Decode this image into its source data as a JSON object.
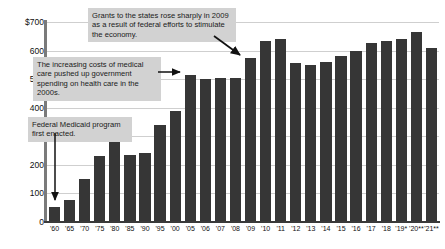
{
  "chart_data": {
    "type": "bar",
    "title": "",
    "subtitle": "",
    "xlabel": "",
    "ylabel": "",
    "ylim": [
      0,
      700
    ],
    "grid": true,
    "legend": "none",
    "y_ticks": [
      "$700",
      "600",
      "500",
      "400",
      "300",
      "200",
      "100",
      "0"
    ],
    "y_tick_values": [
      700,
      600,
      500,
      400,
      300,
      200,
      100,
      0
    ],
    "categories": [
      "'60",
      "'65",
      "'70",
      "'75",
      "'80",
      "'85",
      "'90",
      "'95",
      "'00",
      "'05",
      "'06",
      "'07",
      "'08",
      "'09",
      "'10",
      "'11",
      "'12",
      "'13",
      "'14",
      "'15",
      "'16",
      "'17",
      "'18",
      "'19*",
      "'20**",
      "'21**"
    ],
    "values": [
      52,
      78,
      152,
      232,
      285,
      235,
      242,
      340,
      390,
      515,
      500,
      505,
      505,
      575,
      635,
      640,
      555,
      548,
      560,
      580,
      600,
      628,
      632,
      640,
      665,
      608
    ],
    "annotations": [
      {
        "id": "callout-2009",
        "text": "Grants to the states rose sharply in 2009 as a result of federal efforts to stimulate the economy.",
        "points_to": "'09"
      },
      {
        "id": "callout-medical",
        "text": "The increasing costs of medical care pushed up government spending on health care in the 2000s.",
        "points_to": "'05"
      },
      {
        "id": "callout-medicaid",
        "text": "Federal Medicaid program first enacted.",
        "points_to": "'65"
      }
    ]
  }
}
